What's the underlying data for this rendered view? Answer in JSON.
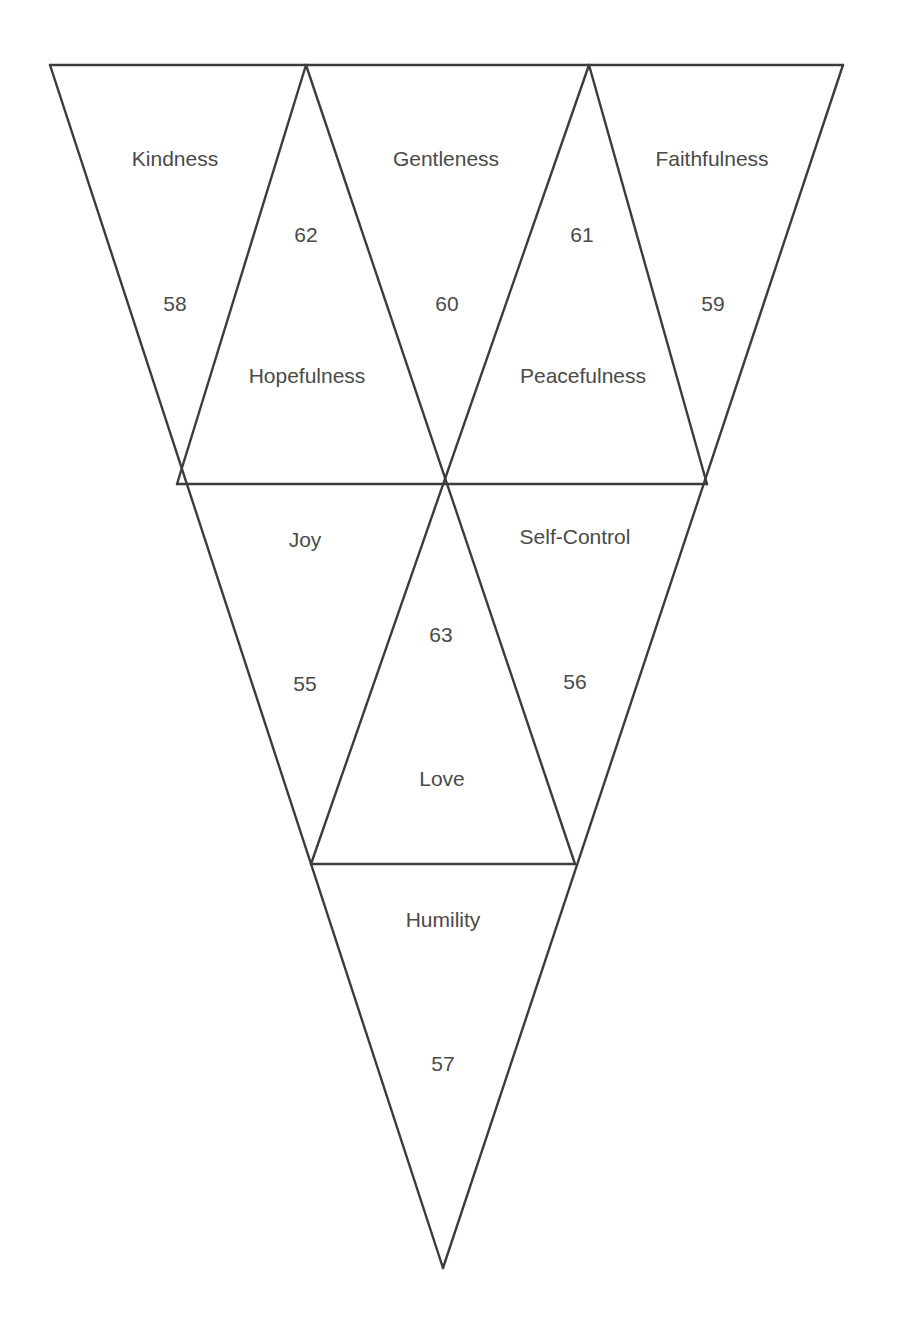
{
  "diagram": {
    "type": "inverted-triangle-grid",
    "line_color": "#3c3c3c",
    "text_color": "#4a4a4a",
    "cells": [
      {
        "id": "kindness",
        "label": "Kindness",
        "value": "58",
        "orientation": "down",
        "row": 1
      },
      {
        "id": "hopefulness",
        "label": "Hopefulness",
        "value": "62",
        "orientation": "up",
        "row": 1
      },
      {
        "id": "gentleness",
        "label": "Gentleness",
        "value": "60",
        "orientation": "down",
        "row": 1
      },
      {
        "id": "peacefulness",
        "label": "Peacefulness",
        "value": "61",
        "orientation": "up",
        "row": 1
      },
      {
        "id": "faithfulness",
        "label": "Faithfulness",
        "value": "59",
        "orientation": "down",
        "row": 1
      },
      {
        "id": "joy",
        "label": "Joy",
        "value": "55",
        "orientation": "down",
        "row": 2
      },
      {
        "id": "love",
        "label": "Love",
        "value": "63",
        "orientation": "up",
        "row": 2
      },
      {
        "id": "self-control",
        "label": "Self-Control",
        "value": "56",
        "orientation": "down",
        "row": 2
      },
      {
        "id": "humility",
        "label": "Humility",
        "value": "57",
        "orientation": "down",
        "row": 3
      }
    ]
  }
}
